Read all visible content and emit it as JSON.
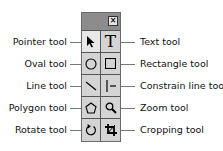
{
  "toolbox": {
    "close_label": "×",
    "tools": [
      {
        "id": "pointer",
        "label": "Pointer tool",
        "icon": "pointer-icon",
        "side": "left",
        "selected": true
      },
      {
        "id": "text",
        "label": "Text tool",
        "icon": "text-icon",
        "side": "right"
      },
      {
        "id": "oval",
        "label": "Oval tool",
        "icon": "oval-icon",
        "side": "left"
      },
      {
        "id": "rectangle",
        "label": "Rectangle tool",
        "icon": "rectangle-icon",
        "side": "right"
      },
      {
        "id": "line",
        "label": "Line tool",
        "icon": "line-icon",
        "side": "left"
      },
      {
        "id": "constrain-line",
        "label": "Constrain line tool",
        "icon": "constrain-line-icon",
        "side": "right"
      },
      {
        "id": "polygon",
        "label": "Polygon tool",
        "icon": "polygon-icon",
        "side": "left"
      },
      {
        "id": "zoom",
        "label": "Zoom tool",
        "icon": "zoom-icon",
        "side": "right"
      },
      {
        "id": "rotate",
        "label": "Rotate tool",
        "icon": "rotate-icon",
        "side": "left"
      },
      {
        "id": "cropping",
        "label": "Cropping tool",
        "icon": "crop-icon",
        "side": "right"
      }
    ]
  },
  "text_glyph": "T"
}
